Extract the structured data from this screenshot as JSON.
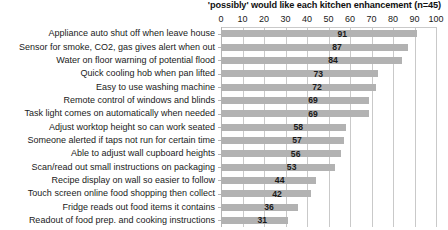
{
  "chart_data": {
    "type": "bar",
    "orientation": "horizontal",
    "title": "'possibly' would like each kitchen enhancement (n=45)",
    "xlabel": "",
    "ylabel": "",
    "xlim": [
      0,
      100
    ],
    "xticks": [
      0,
      10,
      20,
      30,
      40,
      50,
      60,
      70,
      80,
      90,
      100
    ],
    "grid": true,
    "legend": false,
    "bar_color": "#b2b2b2",
    "categories": [
      "Appliance auto shut off when leave house",
      "Sensor for smoke, CO2, gas gives alert when out",
      "Water on floor warning of potential flood",
      "Quick cooling hob when pan lifted",
      "Easy to use washing machine",
      "Remote control of windows and blinds",
      "Task light comes on automatically when needed",
      "Adjust worktop height so can work seated",
      "Someone alerted if taps not run for certain time",
      "Able to adjust wall cupboard heights",
      "Scan/read out small instructions on packaging",
      "Recipe display on wall so easier to follow",
      "Touch screen online food shopping then collect",
      "Fridge reads out food items it contains",
      "Readout of food prep. and cooking instructions"
    ],
    "values": [
      91,
      87,
      84,
      73,
      72,
      69,
      69,
      58,
      57,
      56,
      53,
      44,
      42,
      36,
      31
    ]
  }
}
